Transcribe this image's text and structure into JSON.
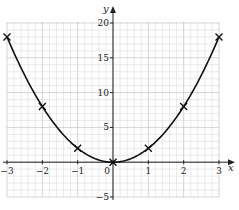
{
  "chart_data": {
    "type": "line",
    "title": "",
    "xlabel": "x",
    "ylabel": "y",
    "xlim": [
      -3,
      3
    ],
    "ylim": [
      -5,
      20
    ],
    "grid": true,
    "x_ticks": [
      "-3",
      "-2",
      "-1",
      "0",
      "1",
      "2",
      "3"
    ],
    "y_ticks": [
      "-5",
      "5",
      "10",
      "15",
      "20"
    ],
    "series": [
      {
        "name": "y = 2x^2",
        "x": [
          -3,
          -2,
          -1,
          0,
          1,
          2,
          3
        ],
        "y": [
          18,
          8,
          2,
          0,
          2,
          8,
          18
        ],
        "marker": "x"
      }
    ]
  },
  "colors": {
    "grid_minor": "#dcdcdc",
    "grid_major": "#b8b8b8",
    "curve": "#111111"
  }
}
